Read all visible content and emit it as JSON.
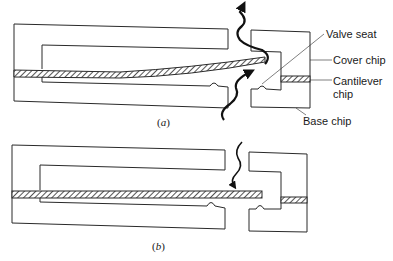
{
  "figure": {
    "labels": {
      "valve_seat": "Valve seat",
      "cover_chip": "Cover chip",
      "cantilever_line1": "Cantilever",
      "cantilever_line2": "chip",
      "base_chip": "Base chip"
    },
    "captions": {
      "a_open": "(",
      "a_letter": "a",
      "a_close": ")",
      "b_open": "(",
      "b_letter": "b",
      "b_close": ")"
    },
    "panels": [
      {
        "id": "a",
        "state": "valve open, cantilever deflected, flow passes"
      },
      {
        "id": "b",
        "state": "valve closed, cantilever flat against seat"
      }
    ],
    "colors": {
      "stroke": "#2a2a2a",
      "background": "#ffffff"
    }
  }
}
